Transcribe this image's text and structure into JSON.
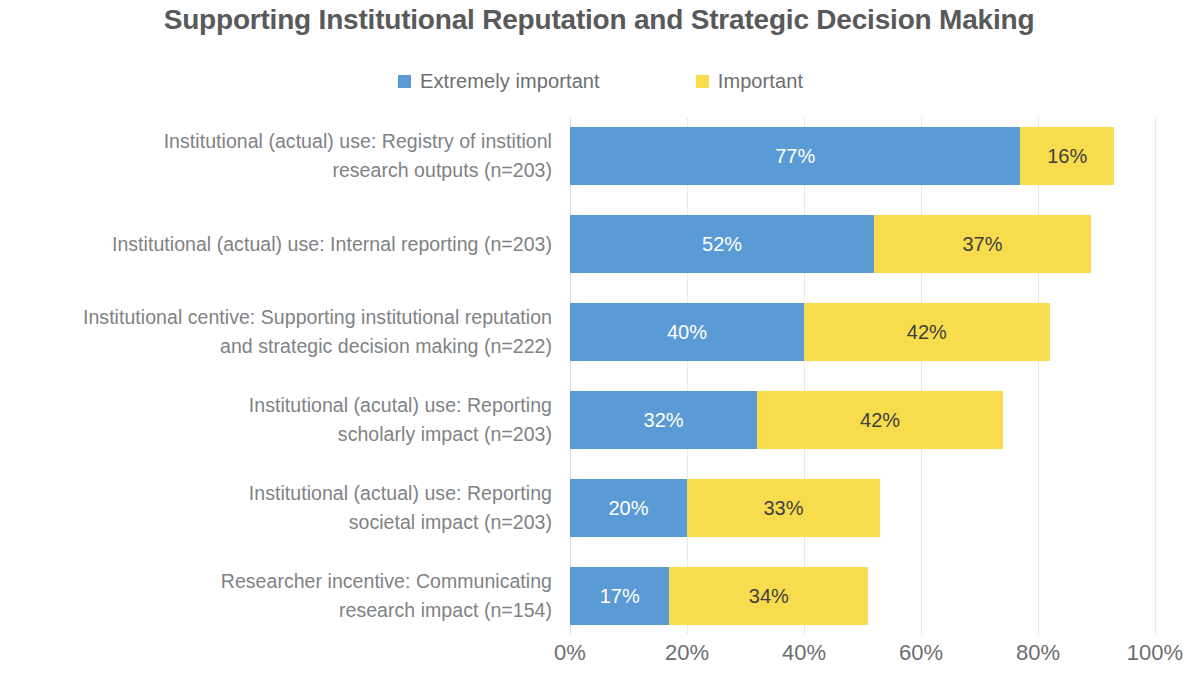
{
  "chart_data": {
    "type": "bar",
    "orientation": "horizontal",
    "stacked": true,
    "title": "Supporting Institutional Reputation and Strategic Decision Making",
    "xlabel": "",
    "ylabel": "",
    "xlim": [
      0,
      100
    ],
    "xticks": [
      "0%",
      "20%",
      "40%",
      "60%",
      "80%",
      "100%"
    ],
    "xtick_values": [
      0,
      20,
      40,
      60,
      80,
      100
    ],
    "grid": true,
    "grid_axis": "x",
    "legend_position": "top-center",
    "value_suffix": "%",
    "categories": [
      "Institutional (actual) use: Registry of institionl research outputs (n=203)",
      "Institutional (actual) use: Internal reporting (n=203)",
      "Institutional centive: Supporting institutional reputation and strategic decision making (n=222)",
      "Institutional (acutal) use: Reporting scholarly impact (n=203)",
      "Institutional (actual) use: Reporting societal impact (n=203)",
      "Researcher incentive: Communicating research impact (n=154)"
    ],
    "category_lines": [
      [
        "Institutional (actual) use: Registry of institionl",
        "research outputs (n=203)"
      ],
      [
        "Institutional (actual) use: Internal reporting (n=203)"
      ],
      [
        "Institutional centive: Supporting institutional reputation",
        "and strategic decision making (n=222)"
      ],
      [
        "Institutional (acutal) use: Reporting",
        "scholarly impact (n=203)"
      ],
      [
        "Institutional (actual) use: Reporting",
        "societal impact (n=203)"
      ],
      [
        "Researcher incentive: Communicating",
        "research impact (n=154)"
      ]
    ],
    "series": [
      {
        "name": "Extremely important",
        "color": "#5B9BD5",
        "values": [
          77,
          52,
          40,
          32,
          20,
          17
        ],
        "labels": [
          "77%",
          "52%",
          "40%",
          "32%",
          "20%",
          "17%"
        ]
      },
      {
        "name": "Important",
        "color": "#F7DC4D",
        "values": [
          16,
          37,
          42,
          42,
          33,
          34
        ],
        "labels": [
          "16%",
          "37%",
          "42%",
          "42%",
          "33%",
          "34%"
        ]
      }
    ]
  },
  "legend": {
    "items": [
      {
        "label": "Extremely important",
        "color": "#5B9BD5",
        "swatch": "legend-swatch-blue"
      },
      {
        "label": "Important",
        "color": "#F7DC4D",
        "swatch": "legend-swatch-yellow"
      }
    ]
  },
  "colors": {
    "series_a": "#5B9BD5",
    "series_b": "#F7DC4D",
    "title_text": "#58595b",
    "label_text": "#808285",
    "tick_text": "#6d6e71",
    "gridline": "#e8e8e8",
    "background": "#ffffff",
    "bar_label_light": "#ffffff",
    "bar_label_dark": "#3f3f3f"
  }
}
